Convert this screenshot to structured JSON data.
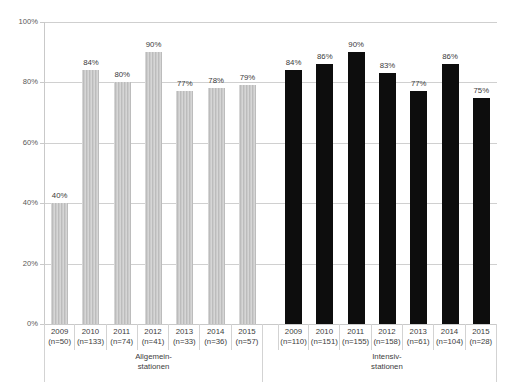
{
  "chart_data": {
    "type": "bar",
    "title": "",
    "subtitle": "",
    "xlabel": "",
    "ylabel": "",
    "ylim": [
      0,
      100
    ],
    "grid": true,
    "legend_position": "none",
    "y_ticks": [
      "0%",
      "20%",
      "40%",
      "60%",
      "80%",
      "100%"
    ],
    "y_tick_values": [
      0,
      20,
      40,
      60,
      80,
      100
    ],
    "value_suffix": "%",
    "categories": [
      "2009",
      "2010",
      "2011",
      "2012",
      "2013",
      "2014",
      "2015"
    ],
    "groups": [
      {
        "name": "Allgemein-\nstationen",
        "label_line1": "Allgemein-",
        "label_line2": "stationen",
        "color": "#c4c4c4",
        "bars": [
          {
            "category": "2009",
            "value": 40,
            "value_label": "40%",
            "n_label": "(n=50)",
            "n": 50
          },
          {
            "category": "2010",
            "value": 84,
            "value_label": "84%",
            "n_label": "(n=133)",
            "n": 133
          },
          {
            "category": "2011",
            "value": 80,
            "value_label": "80%",
            "n_label": "(n=74)",
            "n": 74
          },
          {
            "category": "2012",
            "value": 90,
            "value_label": "90%",
            "n_label": "(n=41)",
            "n": 41
          },
          {
            "category": "2013",
            "value": 77,
            "value_label": "77%",
            "n_label": "(n=33)",
            "n": 33
          },
          {
            "category": "2014",
            "value": 78,
            "value_label": "78%",
            "n_label": "(n=36)",
            "n": 36
          },
          {
            "category": "2015",
            "value": 79,
            "value_label": "79%",
            "n_label": "(n=57)",
            "n": 57
          }
        ]
      },
      {
        "name": "Intensiv-\nstationen",
        "label_line1": "Intensiv-",
        "label_line2": "stationen",
        "color": "#0d0d0d",
        "bars": [
          {
            "category": "2009",
            "value": 84,
            "value_label": "84%",
            "n_label": "(n=110)",
            "n": 110
          },
          {
            "category": "2010",
            "value": 86,
            "value_label": "86%",
            "n_label": "(n=151)",
            "n": 151
          },
          {
            "category": "2011",
            "value": 90,
            "value_label": "90%",
            "n_label": "(n=155)",
            "n": 155
          },
          {
            "category": "2012",
            "value": 83,
            "value_label": "83%",
            "n_label": "(n=158)",
            "n": 158
          },
          {
            "category": "2013",
            "value": 77,
            "value_label": "77%",
            "n_label": "(n=61)",
            "n": 61
          },
          {
            "category": "2014",
            "value": 86,
            "value_label": "86%",
            "n_label": "(n=104)",
            "n": 104
          },
          {
            "category": "2015",
            "value": 75,
            "value_label": "75%",
            "n_label": "(n=28)",
            "n": 28
          }
        ]
      }
    ]
  }
}
